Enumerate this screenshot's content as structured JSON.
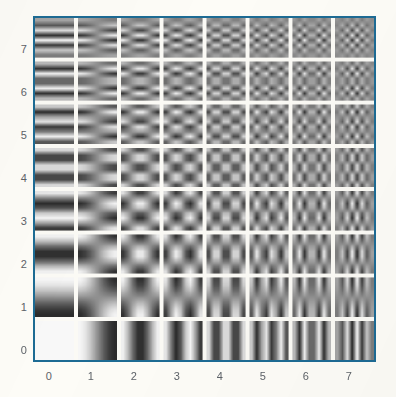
{
  "figure": {
    "name": "dct-basis-functions",
    "background_color": "#fdfcf7",
    "frame_color": "#1d6b94",
    "label_color": "#5d6268"
  },
  "axes": {
    "x_tick_labels": [
      "0",
      "1",
      "2",
      "3",
      "4",
      "5",
      "6",
      "7"
    ],
    "y_tick_labels": [
      "0",
      "1",
      "2",
      "3",
      "4",
      "5",
      "6",
      "7"
    ]
  },
  "chart_data": {
    "type": "heatmap",
    "title": "",
    "xlabel": "",
    "ylabel": "",
    "grid": true,
    "legend": "none",
    "xlim": [
      0,
      8
    ],
    "ylim": [
      0,
      8
    ],
    "x": [
      0,
      1,
      2,
      3,
      4,
      5,
      6,
      7
    ],
    "y": [
      0,
      1,
      2,
      3,
      4,
      5,
      6,
      7
    ],
    "xtick_labels": [
      "0",
      "1",
      "2",
      "3",
      "4",
      "5",
      "6",
      "7"
    ],
    "ytick_labels": [
      "0",
      "1",
      "2",
      "3",
      "4",
      "5",
      "6",
      "7"
    ],
    "cells_x": 8,
    "cells_y": 8,
    "block_pixels": 8,
    "colormap": "gray",
    "value_range": [
      -1,
      1
    ],
    "gray_min": 28,
    "gray_max": 248,
    "cell_gap_px": 4,
    "cells": [
      {
        "u": 0,
        "v": 0,
        "pattern": "uniform-flat"
      },
      {
        "u": 1,
        "v": 0,
        "pattern": "1-cycle horizontal gradient"
      },
      {
        "u": 2,
        "v": 0,
        "pattern": "2 vertical bars"
      },
      {
        "u": 3,
        "v": 0,
        "pattern": "3 vertical bars"
      },
      {
        "u": 4,
        "v": 0,
        "pattern": "4 vertical bars"
      },
      {
        "u": 5,
        "v": 0,
        "pattern": "5 vertical bars"
      },
      {
        "u": 6,
        "v": 0,
        "pattern": "6 vertical bars"
      },
      {
        "u": 7,
        "v": 0,
        "pattern": "7 vertical bars"
      },
      {
        "u": 0,
        "v": 1,
        "pattern": "1-cycle vertical gradient"
      },
      {
        "u": 7,
        "v": 7,
        "pattern": "fine checkerboard"
      },
      {
        "u": 0,
        "v": 7,
        "pattern": "7 horizontal bars"
      }
    ]
  }
}
